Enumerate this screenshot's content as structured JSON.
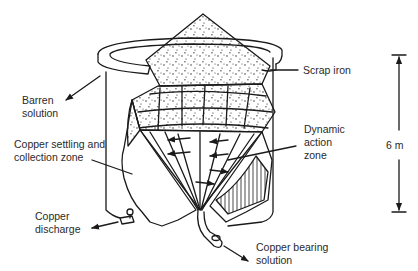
{
  "diagram": {
    "labels": {
      "barren_solution": [
        "Barren",
        "solution"
      ],
      "scrap_iron": "Scrap iron",
      "copper_settling": [
        "Copper settling and",
        "collection zone"
      ],
      "dynamic_action": [
        "Dynamic",
        "action",
        "zone"
      ],
      "copper_discharge": [
        "Copper",
        "discharge"
      ],
      "copper_bearing": [
        "Copper bearing",
        "solution"
      ],
      "height_dimension": "6 m"
    },
    "colors": {
      "ink": "#1a1a1a",
      "text": "#2a2a2a",
      "background": "#ffffff"
    }
  }
}
